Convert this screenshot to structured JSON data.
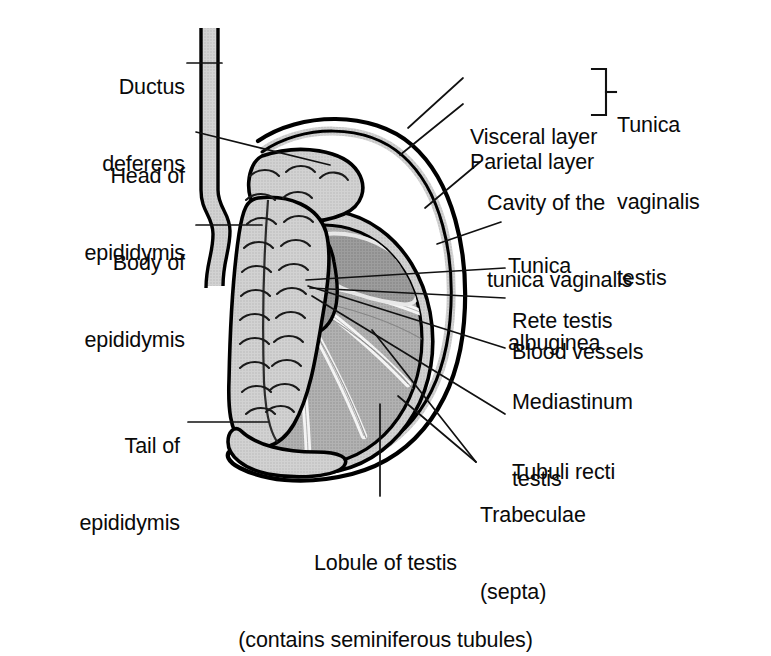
{
  "figure": {
    "caption_lines": [
      "Lobule of testis",
      "(contains seminiferous tubules)"
    ]
  },
  "colors": {
    "outline": "#000000",
    "background": "#ffffff",
    "epididymis_fill": "#c9c9c9",
    "mediastinum_fill": "#9a9a9a",
    "lobule_fill": "#ababab",
    "tunica_albuginea": "#cfcfcf",
    "cavity_fill": "#ffffff",
    "vaginalis_fill": "#d8d8d8",
    "septa": "#f2f2f2",
    "leader_line": "#111111",
    "text": "#0a0a0a"
  },
  "labels": {
    "left": [
      {
        "id": "ductus-deferens",
        "lines": [
          "Ductus",
          "deferens"
        ],
        "x": 80,
        "y": 24,
        "align": "left"
      },
      {
        "id": "head-of-epididymis",
        "lines": [
          "Head of",
          "epididymis"
        ],
        "x": 62,
        "y": 113,
        "align": "left"
      },
      {
        "id": "body-of-epididymis",
        "lines": [
          "Body of",
          "epididymis"
        ],
        "x": 62,
        "y": 200,
        "align": "left"
      },
      {
        "id": "tail-of-epididymis",
        "lines": [
          "Tail of",
          "epididymis"
        ],
        "x": 62,
        "y": 383,
        "align": "left"
      }
    ],
    "right": [
      {
        "id": "visceral-layer",
        "lines": [
          "Visceral layer"
        ],
        "x": 470,
        "y": 74,
        "align": "right"
      },
      {
        "id": "parietal-layer",
        "lines": [
          "Parietal layer"
        ],
        "x": 470,
        "y": 99,
        "align": "right"
      },
      {
        "id": "tunica-vaginalis-testis",
        "lines": [
          "Tunica",
          "vaginalis",
          "testis"
        ],
        "x": 617,
        "y": 62,
        "align": "right"
      },
      {
        "id": "cavity-of-tunica-vaginalis",
        "lines": [
          "Cavity of the",
          "tunica vaginalis"
        ],
        "x": 487,
        "y": 140,
        "align": "right"
      },
      {
        "id": "tunica-albuginea",
        "lines": [
          "Tunica",
          "albuginea"
        ],
        "x": 508,
        "y": 203,
        "align": "right"
      },
      {
        "id": "rete-testis",
        "lines": [
          "Rete testis"
        ],
        "x": 512,
        "y": 258,
        "align": "right"
      },
      {
        "id": "blood-vessels",
        "lines": [
          "Blood vessels"
        ],
        "x": 512,
        "y": 289,
        "align": "right"
      },
      {
        "id": "mediastinum-testis",
        "lines": [
          "Mediastinum",
          "testis"
        ],
        "x": 512,
        "y": 339,
        "align": "right"
      },
      {
        "id": "tubuli-recti",
        "lines": [
          "Tubuli recti"
        ],
        "x": 512,
        "y": 409,
        "align": "right"
      },
      {
        "id": "trabeculae-septa",
        "lines": [
          "Trabeculae",
          "(septa)"
        ],
        "x": 480,
        "y": 452,
        "align": "right"
      }
    ],
    "bottom": [
      {
        "id": "lobule-of-testis",
        "lines": [
          "Lobule of testis",
          "(contains seminiferous tubules)"
        ],
        "x": 385,
        "y": 500,
        "align": "center"
      }
    ]
  },
  "structures": [
    {
      "id": "ductus-deferens",
      "name": "Ductus deferens"
    },
    {
      "id": "head-of-epididymis",
      "name": "Head of epididymis"
    },
    {
      "id": "body-of-epididymis",
      "name": "Body of epididymis"
    },
    {
      "id": "tail-of-epididymis",
      "name": "Tail of epididymis"
    },
    {
      "id": "visceral-layer",
      "name": "Visceral layer of tunica vaginalis"
    },
    {
      "id": "parietal-layer",
      "name": "Parietal layer of tunica vaginalis"
    },
    {
      "id": "cavity-of-tunica-vaginalis",
      "name": "Cavity of the tunica vaginalis"
    },
    {
      "id": "tunica-albuginea",
      "name": "Tunica albuginea"
    },
    {
      "id": "rete-testis",
      "name": "Rete testis"
    },
    {
      "id": "blood-vessels",
      "name": "Blood vessels"
    },
    {
      "id": "mediastinum-testis",
      "name": "Mediastinum testis"
    },
    {
      "id": "tubuli-recti",
      "name": "Tubuli recti"
    },
    {
      "id": "trabeculae-septa",
      "name": "Trabeculae (septa)"
    },
    {
      "id": "lobule-of-testis",
      "name": "Lobule of testis"
    }
  ]
}
